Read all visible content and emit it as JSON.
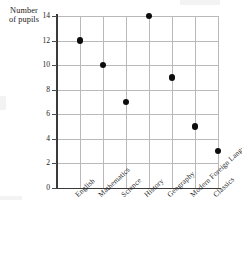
{
  "chart_data": {
    "type": "scatter",
    "title": "",
    "subtitle": "",
    "xlabel": "",
    "ylabel": "Number of pupils",
    "ylabel_lines": [
      "Number",
      "of pupils"
    ],
    "categories": [
      "English",
      "Mathematics",
      "Science",
      "History",
      "Geography",
      "Modern Foreign Languages",
      "Classics"
    ],
    "values": [
      12,
      10,
      7,
      14,
      9,
      5,
      3
    ],
    "series": [
      {
        "name": "Number of pupils",
        "values": [
          12,
          10,
          7,
          14,
          9,
          5,
          3
        ]
      }
    ],
    "points": [
      {
        "category": "English",
        "value": 12
      },
      {
        "category": "Mathematics",
        "value": 10
      },
      {
        "category": "Science",
        "value": 7
      },
      {
        "category": "History",
        "value": 14
      },
      {
        "category": "Geography",
        "value": 9
      },
      {
        "category": "Modern Foreign Languages",
        "value": 5
      },
      {
        "category": "Classics",
        "value": 3
      }
    ],
    "ylim": [
      0,
      14
    ],
    "ytick_labels": [
      "0",
      "2",
      "4",
      "6",
      "8",
      "10",
      "12",
      "14"
    ],
    "ytick_values": [
      0,
      2,
      4,
      6,
      8,
      10,
      12,
      14
    ],
    "grid": true,
    "grid_color": "#b9b9b9",
    "legend": false,
    "legend_position": "none",
    "marker_color": "#0d0d0d",
    "marker_shape": "circle",
    "axis_color": "#3a3a3a",
    "background_color": "#ffffff"
  }
}
